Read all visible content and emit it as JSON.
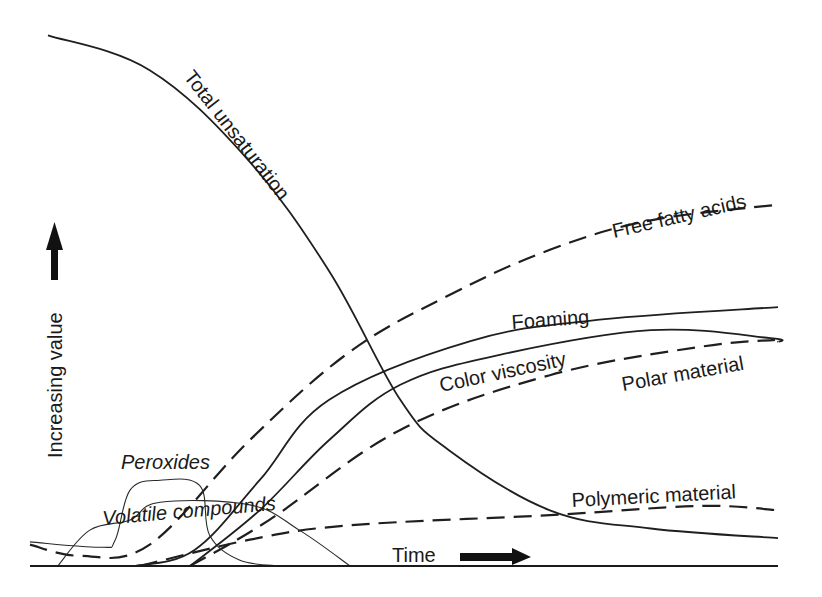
{
  "chart_data": {
    "type": "line",
    "title": "",
    "xlabel": "Time",
    "ylabel": "Increasing value",
    "xlim": [
      0,
      100
    ],
    "ylim": [
      0,
      100
    ],
    "grid": false,
    "legend": "none (inline curve labels)",
    "x_axis_arrow": "right",
    "y_axis_arrow": "up",
    "series": [
      {
        "name": "Total unsaturation",
        "style": "solid",
        "x": [
          2.4,
          16,
          29,
          40,
          49.5,
          56,
          69.5,
          83,
          100
        ],
        "y": [
          99,
          92.5,
          76,
          55,
          31,
          21.6,
          10.4,
          7,
          5.2
        ]
      },
      {
        "name": "Free fatty acids",
        "style": "dashed",
        "x": [
          0,
          6.7,
          16,
          29.4,
          42.8,
          56,
          69.5,
          83,
          100
        ],
        "y": [
          4,
          1.9,
          4,
          23.5,
          40,
          50.5,
          59,
          64.5,
          67.4
        ]
      },
      {
        "name": "Foaming",
        "style": "solid",
        "x": [
          14,
          22,
          30.7,
          40,
          59,
          76.5,
          100
        ],
        "y": [
          0,
          3,
          16,
          31,
          42,
          46,
          48.3
        ]
      },
      {
        "name": "Color viscosity",
        "style": "solid",
        "x": [
          21.4,
          30.7,
          40,
          49.5,
          62.8,
          83,
          99,
          100
        ],
        "y": [
          0,
          10.4,
          23.5,
          33.8,
          39.4,
          44,
          42.5,
          41.8
        ]
      },
      {
        "name": "Polar material",
        "style": "dashed",
        "x": [
          21.4,
          32,
          49.5,
          69.5,
          89.6,
          99.6
        ],
        "y": [
          0,
          8.6,
          25.4,
          35.6,
          40.9,
          42.2
        ]
      },
      {
        "name": "Polymeric material",
        "style": "dashed",
        "x": [
          14.7,
          29.4,
          42.8,
          69.5,
          89.6,
          100
        ],
        "y": [
          0,
          4.9,
          7.6,
          9.5,
          11.2,
          10.4
        ]
      },
      {
        "name": "Peroxides",
        "style": "thin",
        "x": [
          0,
          9.4,
          11.4,
          13.4,
          17.4,
          22.7,
          24,
          28,
          33.4
        ],
        "y": [
          4.5,
          3.5,
          4.9,
          14.2,
          16,
          15,
          5.8,
          1.1,
          0
        ]
      },
      {
        "name": "Volatile compounds",
        "style": "thin",
        "x": [
          3.7,
          8.0,
          13.4,
          17.4,
          29.4,
          36,
          42.8
        ],
        "y": [
          0,
          6.7,
          8.6,
          11.9,
          11.4,
          6.7,
          0
        ]
      }
    ]
  },
  "labels": {
    "total_unsaturation": "Total unsaturation",
    "free_fatty_acids": "Free fatty acids",
    "foaming": "Foaming",
    "color_viscosity": "Color viscosity",
    "polar_material": "Polar material",
    "polymeric_material": "Polymeric material",
    "peroxides": "Peroxides",
    "volatile_compounds": "Volatile compounds",
    "time": "Time",
    "increasing_value": "Increasing value"
  },
  "icons": {
    "x_arrow": "right-arrow-icon",
    "y_arrow": "up-arrow-icon"
  }
}
